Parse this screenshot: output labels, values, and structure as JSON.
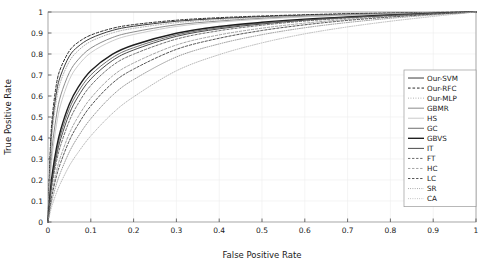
{
  "chart_data": {
    "type": "line",
    "title": "",
    "xlabel": "False Positive Rate",
    "ylabel": "True Positive Rate",
    "xlim": [
      0,
      1
    ],
    "ylim": [
      0,
      1
    ],
    "grid": true,
    "legend_position": "right-middle",
    "xticks": [
      "0",
      "0.1",
      "0.2",
      "0.3",
      "0.4",
      "0.5",
      "0.6",
      "0.7",
      "0.8",
      "0.9",
      "1"
    ],
    "yticks": [
      "0",
      "0.1",
      "0.2",
      "0.3",
      "0.4",
      "0.5",
      "0.6",
      "0.7",
      "0.8",
      "0.9",
      "1"
    ],
    "x": [
      0,
      0.005,
      0.01,
      0.02,
      0.03,
      0.05,
      0.07,
      0.1,
      0.15,
      0.2,
      0.3,
      0.4,
      0.5,
      0.6,
      0.7,
      0.8,
      0.9,
      1
    ],
    "series": [
      {
        "name": "Our-SVM",
        "style": "solid",
        "color": "#3c3c3c",
        "width": 1.0,
        "values": [
          0,
          0.3,
          0.46,
          0.62,
          0.7,
          0.79,
          0.835,
          0.875,
          0.912,
          0.932,
          0.956,
          0.969,
          0.978,
          0.985,
          0.99,
          0.994,
          0.997,
          1.0
        ]
      },
      {
        "name": "Our-RFC",
        "style": "dashed",
        "color": "#2a2a2a",
        "width": 1.0,
        "values": [
          0,
          0.33,
          0.5,
          0.66,
          0.735,
          0.815,
          0.855,
          0.89,
          0.922,
          0.94,
          0.961,
          0.973,
          0.981,
          0.987,
          0.992,
          0.995,
          0.998,
          1.0
        ]
      },
      {
        "name": "Our-MLP",
        "style": "dotted",
        "color": "#aaaaaa",
        "width": 1.0,
        "values": [
          0,
          0.27,
          0.43,
          0.585,
          0.672,
          0.765,
          0.815,
          0.86,
          0.9,
          0.922,
          0.949,
          0.964,
          0.974,
          0.982,
          0.988,
          0.993,
          0.997,
          1.0
        ]
      },
      {
        "name": "GBMR",
        "style": "solid",
        "color": "#8c8c8c",
        "width": 1.0,
        "values": [
          0,
          0.22,
          0.36,
          0.51,
          0.605,
          0.712,
          0.772,
          0.828,
          0.878,
          0.905,
          0.939,
          0.957,
          0.97,
          0.979,
          0.986,
          0.991,
          0.996,
          1.0
        ]
      },
      {
        "name": "HS",
        "style": "solid",
        "color": "#c4c4c4",
        "width": 0.9,
        "values": [
          0,
          0.19,
          0.32,
          0.465,
          0.562,
          0.678,
          0.744,
          0.806,
          0.862,
          0.893,
          0.931,
          0.952,
          0.966,
          0.977,
          0.984,
          0.99,
          0.995,
          1.0
        ]
      },
      {
        "name": "GC",
        "style": "solid",
        "color": "#6e6e6e",
        "width": 1.0,
        "values": [
          0,
          0.125,
          0.215,
          0.335,
          0.42,
          0.54,
          0.618,
          0.7,
          0.782,
          0.83,
          0.891,
          0.925,
          0.947,
          0.963,
          0.975,
          0.985,
          0.993,
          1.0
        ]
      },
      {
        "name": "GBVS",
        "style": "solid",
        "color": "#1e1e1e",
        "width": 1.4,
        "values": [
          0,
          0.135,
          0.23,
          0.355,
          0.442,
          0.562,
          0.64,
          0.72,
          0.798,
          0.843,
          0.899,
          0.931,
          0.951,
          0.966,
          0.977,
          0.986,
          0.994,
          1.0
        ]
      },
      {
        "name": "IT",
        "style": "solid",
        "color": "#4a4a4a",
        "width": 1.0,
        "values": [
          0,
          0.115,
          0.2,
          0.315,
          0.398,
          0.516,
          0.596,
          0.681,
          0.768,
          0.819,
          0.884,
          0.92,
          0.943,
          0.961,
          0.974,
          0.984,
          0.993,
          1.0
        ]
      },
      {
        "name": "FT",
        "style": "dashed",
        "color": "#5a5a5a",
        "width": 0.9,
        "values": [
          0,
          0.105,
          0.182,
          0.29,
          0.368,
          0.482,
          0.562,
          0.65,
          0.744,
          0.799,
          0.871,
          0.911,
          0.937,
          0.957,
          0.971,
          0.982,
          0.992,
          1.0
        ]
      },
      {
        "name": "HC",
        "style": "dashed",
        "color": "#9a9a9a",
        "width": 0.9,
        "values": [
          0,
          0.085,
          0.15,
          0.245,
          0.315,
          0.422,
          0.5,
          0.59,
          0.694,
          0.757,
          0.843,
          0.891,
          0.923,
          0.947,
          0.965,
          0.979,
          0.99,
          1.0
        ]
      },
      {
        "name": "LC",
        "style": "dashed",
        "color": "#3f3f3f",
        "width": 0.9,
        "values": [
          0,
          0.075,
          0.133,
          0.22,
          0.285,
          0.388,
          0.463,
          0.553,
          0.66,
          0.728,
          0.822,
          0.875,
          0.912,
          0.939,
          0.96,
          0.976,
          0.989,
          1.0
        ]
      },
      {
        "name": "SR",
        "style": "dotted",
        "color": "#8a8a8a",
        "width": 0.9,
        "values": [
          0,
          0.06,
          0.108,
          0.182,
          0.24,
          0.334,
          0.405,
          0.492,
          0.602,
          0.678,
          0.786,
          0.848,
          0.892,
          0.925,
          0.95,
          0.97,
          0.986,
          1.0
        ]
      },
      {
        "name": "CA",
        "style": "dotted",
        "color": "#b0b0b0",
        "width": 0.9,
        "values": [
          0,
          0.045,
          0.082,
          0.14,
          0.188,
          0.268,
          0.33,
          0.41,
          0.516,
          0.596,
          0.72,
          0.797,
          0.853,
          0.896,
          0.929,
          0.956,
          0.979,
          1.0
        ]
      }
    ]
  }
}
